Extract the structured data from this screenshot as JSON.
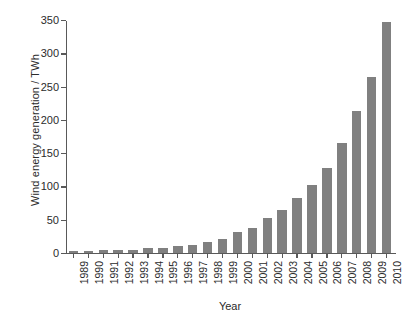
{
  "chart_data": {
    "type": "bar",
    "title": "",
    "xlabel": "Year",
    "ylabel": "Wind energy generation / TWh",
    "categories": [
      "1989",
      "1990",
      "1991",
      "1992",
      "1993",
      "1994",
      "1995",
      "1996",
      "1997",
      "1998",
      "1999",
      "2000",
      "2001",
      "2002",
      "2003",
      "2004",
      "2005",
      "2006",
      "2007",
      "2008",
      "2009",
      "2010"
    ],
    "values": [
      3,
      3.5,
      4,
      4.5,
      5,
      7,
      8,
      10,
      12,
      17,
      21,
      31,
      38,
      53,
      64,
      82,
      102,
      128,
      166,
      214,
      265,
      347
    ],
    "ylim": [
      0,
      350
    ],
    "yticks": [
      0,
      50,
      100,
      150,
      200,
      250,
      300,
      350
    ],
    "ytick_labels": [
      "0",
      "50",
      "100",
      "150",
      "200",
      "250",
      "300",
      "350"
    ],
    "grid": false,
    "legend": false,
    "bar_color": "#808080",
    "axis_color": "#595959",
    "text_color": "#2b2b2b",
    "background": "#ffffff"
  }
}
